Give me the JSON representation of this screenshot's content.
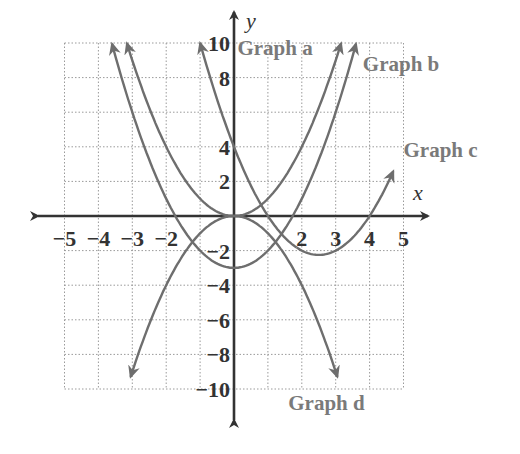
{
  "chart_data": {
    "type": "line",
    "title": "",
    "xlabel": "x",
    "ylabel": "y",
    "xlim": [
      -5,
      5
    ],
    "ylim": [
      -10,
      10
    ],
    "grid": true,
    "x_ticks": [
      -5,
      -4,
      -3,
      -2,
      2,
      3,
      4,
      5
    ],
    "x_tick_labels": [
      "−5",
      "−4",
      "−3",
      "−2",
      "2",
      "3",
      "4",
      "5"
    ],
    "y_ticks": [
      10,
      8,
      4,
      2,
      -2,
      -4,
      -6,
      -8,
      -10
    ],
    "y_tick_labels": [
      "10",
      "8",
      "4",
      "2",
      "−2",
      "−4",
      "−6",
      "−8",
      "−10"
    ],
    "series": [
      {
        "name": "Graph a",
        "equation": "y = x^2",
        "x_range": [
          -3.16,
          3.16
        ],
        "color": "#6e6e6e"
      },
      {
        "name": "Graph b",
        "equation": "y = x^2 - 3",
        "x_range": [
          -3.6,
          3.6
        ],
        "color": "#6e6e6e"
      },
      {
        "name": "Graph c",
        "equation": "y = x^2 - 5x + 4",
        "x_range": [
          -1.0,
          4.7
        ],
        "color": "#6e6e6e"
      },
      {
        "name": "Graph d",
        "equation": "y = -x^2",
        "x_range": [
          -3.05,
          3.05
        ],
        "color": "#6e6e6e"
      }
    ],
    "annotations": [
      {
        "text": "Graph a",
        "x": 0.1,
        "y": 9.7
      },
      {
        "text": "Graph b",
        "x": 3.8,
        "y": 8.8
      },
      {
        "text": "Graph c",
        "x": 5.0,
        "y": 3.8
      },
      {
        "text": "Graph d",
        "x": 1.6,
        "y": -10.8
      }
    ]
  }
}
